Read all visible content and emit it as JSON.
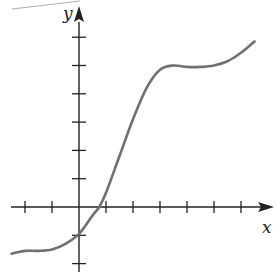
{
  "chart_data": {
    "type": "line",
    "title": "",
    "xlabel": "x",
    "ylabel": "y",
    "xlim": [
      -2.5,
      7
    ],
    "ylim": [
      -2,
      6.5
    ],
    "xticks": [
      -2,
      -1,
      1,
      2,
      3,
      4,
      5,
      6
    ],
    "yticks": [
      -2,
      -1,
      1,
      2,
      3,
      4,
      5,
      6
    ],
    "tick_labels_shown": false,
    "grid": false,
    "series": [
      {
        "name": "f(x)",
        "color": "#707070",
        "x": [
          -2.5,
          -2,
          -1.5,
          -1,
          -0.5,
          0,
          0.5,
          0.75,
          1,
          1.5,
          2,
          2.5,
          3,
          3.5,
          4,
          4.5,
          5,
          5.5,
          6,
          6.5
        ],
        "y": [
          -1.65,
          -1.55,
          -1.55,
          -1.5,
          -1.3,
          -0.95,
          -0.3,
          0,
          0.5,
          1.8,
          3.1,
          4.2,
          4.85,
          5.0,
          4.95,
          4.95,
          5.0,
          5.15,
          5.45,
          5.85
        ]
      }
    ]
  },
  "axes": {
    "x_label": "x",
    "y_label": "y",
    "axis_color": "#222222"
  }
}
